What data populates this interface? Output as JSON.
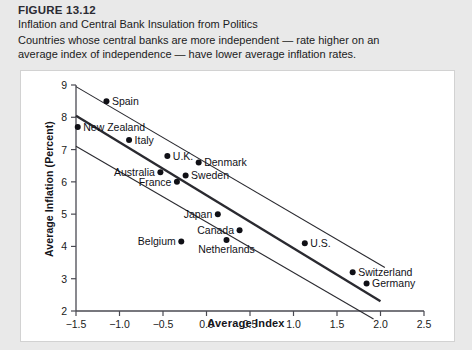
{
  "figure": {
    "number": "FIGURE 13.12",
    "title": "Inflation and Central Bank Insulation from Politics",
    "subtitle_line1": "Countries whose central banks are more independent — rate higher on an",
    "subtitle_line2": "average index of independence — have lower average inflation rates."
  },
  "chart_data": {
    "type": "scatter",
    "title": "Inflation and Central Bank Insulation from Politics",
    "xlabel": "Average Index",
    "ylabel": "Average Inflation (Percent)",
    "xlim": [
      -1.5,
      2.5
    ],
    "ylim": [
      2,
      9
    ],
    "xticks": [
      "-1.5",
      "-1.0",
      "-0.5",
      "0.0",
      "0.5",
      "1.0",
      "1.5",
      "2.0",
      "2.5"
    ],
    "xtick_values": [
      -1.5,
      -1.0,
      -0.5,
      0.0,
      0.5,
      1.0,
      1.5,
      2.0,
      2.5
    ],
    "yticks": [
      "2",
      "3",
      "4",
      "5",
      "6",
      "7",
      "8",
      "9"
    ],
    "ytick_values": [
      2,
      3,
      4,
      5,
      6,
      7,
      8,
      9
    ],
    "grid": false,
    "legend": "none",
    "points": [
      {
        "label": "Spain",
        "x": -1.15,
        "y": 8.5,
        "label_side": "right"
      },
      {
        "label": "New Zealand",
        "x": -1.48,
        "y": 7.7,
        "label_side": "right"
      },
      {
        "label": "Italy",
        "x": -0.89,
        "y": 7.3,
        "label_side": "right"
      },
      {
        "label": "U.K.",
        "x": -0.45,
        "y": 6.8,
        "label_side": "right"
      },
      {
        "label": "Denmark",
        "x": -0.09,
        "y": 6.6,
        "label_side": "right"
      },
      {
        "label": "Australia",
        "x": -0.53,
        "y": 6.3,
        "label_side": "left"
      },
      {
        "label": "Sweden",
        "x": -0.24,
        "y": 6.2,
        "label_side": "right"
      },
      {
        "label": "France",
        "x": -0.34,
        "y": 6.0,
        "label_side": "left"
      },
      {
        "label": "Japan",
        "x": 0.13,
        "y": 5.0,
        "label_side": "left"
      },
      {
        "label": "Canada",
        "x": 0.38,
        "y": 4.5,
        "label_side": "left"
      },
      {
        "label": "Netherlands",
        "x": 0.23,
        "y": 4.2,
        "label_side": "below"
      },
      {
        "label": "Belgium",
        "x": -0.29,
        "y": 4.15,
        "label_side": "left"
      },
      {
        "label": "U.S.",
        "x": 1.13,
        "y": 4.1,
        "label_side": "right"
      },
      {
        "label": "Switzerland",
        "x": 1.68,
        "y": 3.2,
        "label_side": "right"
      },
      {
        "label": "Germany",
        "x": 1.84,
        "y": 2.85,
        "label_side": "right"
      }
    ],
    "lines": [
      {
        "name": "upper-band",
        "x0": -1.5,
        "y0": 8.95,
        "x1": 2.05,
        "y1": 3.35,
        "weight": "thin"
      },
      {
        "name": "regression",
        "x0": -1.5,
        "y0": 8.05,
        "x1": 2.0,
        "y1": 2.3,
        "weight": "thick"
      },
      {
        "name": "lower-band",
        "x0": -1.5,
        "y0": 7.1,
        "x1": 1.92,
        "y1": 1.75,
        "weight": "thin"
      }
    ]
  },
  "colors": {
    "page_background": "#e9e9e9",
    "panel_background": "#ffffff",
    "axis": "#4a4a52",
    "point": "#101016",
    "text": "#15151b",
    "line": "#2a2a30"
  }
}
